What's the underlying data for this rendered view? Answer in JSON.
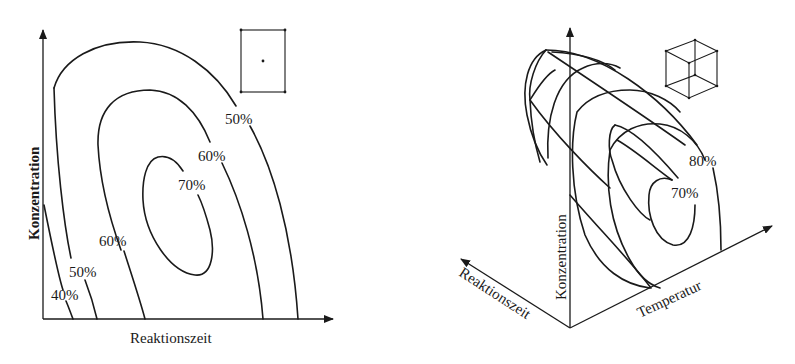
{
  "left_panel": {
    "type": "2D contour plot",
    "x_axis_label": "Reaktionszeit",
    "y_axis_label": "Konzentration",
    "icon": "rectangle-with-center-point-icon",
    "contours": [
      {
        "label": "40%",
        "kind": "open"
      },
      {
        "label": "50%",
        "kind": "open"
      },
      {
        "label": "60%",
        "kind": "open"
      },
      {
        "label": "60%",
        "kind": "open"
      },
      {
        "label": "70%",
        "kind": "closed"
      },
      {
        "label": "50%",
        "kind": "open"
      }
    ],
    "labels": {
      "c40": "40%",
      "c50_low": "50%",
      "c60_low": "60%",
      "c70": "70%",
      "c60_high": "60%",
      "c50_high": "50%"
    }
  },
  "right_panel": {
    "type": "3D response surface",
    "x_axis_label": "Reaktionszeit",
    "y_axis_label": "Konzentration",
    "z_axis_label": "Temperatur",
    "icon": "cube-wireframe-icon",
    "labels": {
      "c80": "80%",
      "c70": "70%"
    }
  },
  "colors": {
    "ink": "#1a1a1a",
    "background": "#ffffff"
  }
}
